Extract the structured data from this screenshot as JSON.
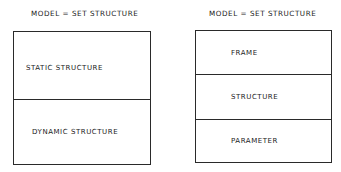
{
  "diagrams": [
    {
      "title": "MODEL = SET STRUCTURE",
      "sections": [
        {
          "label": "STATIC  STRUCTURE"
        },
        {
          "label": "DYNAMIC  STRUCTURE"
        }
      ]
    },
    {
      "title": "MODEL = SET STRUCTURE",
      "sections": [
        {
          "label": "FRAME"
        },
        {
          "label": "STRUCTURE"
        },
        {
          "label": "PARAMETER"
        }
      ]
    }
  ],
  "colors": {
    "line": "#2a2a2a",
    "text": "#1a1a1a",
    "background": "#ffffff"
  }
}
